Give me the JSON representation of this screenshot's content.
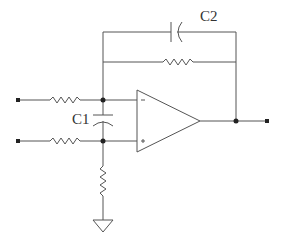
{
  "diagram": {
    "type": "circuit-schematic",
    "title": "",
    "components": {
      "capacitor_feedback": {
        "label": "C2"
      },
      "capacitor_input": {
        "label": "C1"
      },
      "opamp": {
        "inverting_symbol": "−",
        "noninverting_symbol": "+"
      }
    },
    "colors": {
      "line": "#555555",
      "background": "#ffffff"
    }
  }
}
